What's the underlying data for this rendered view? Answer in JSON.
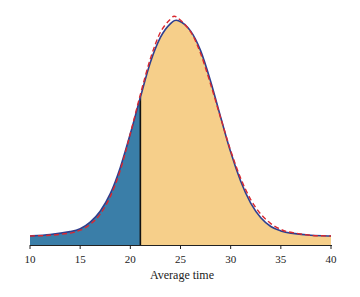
{
  "chart_data": {
    "type": "area",
    "title": "",
    "xlabel": "Average time",
    "ylabel": "",
    "xlim": [
      10,
      40
    ],
    "x_ticks": [
      10,
      15,
      20,
      25,
      30,
      35,
      40
    ],
    "grid": false,
    "legend": null,
    "cutoff": 21,
    "series": [
      {
        "name": "Sampling distribution (solid)",
        "style": "solid",
        "color": "#2e3f8f",
        "x": [
          10,
          12,
          14,
          15,
          16,
          17,
          18,
          19,
          20,
          21,
          22,
          23,
          24,
          24.8,
          26,
          27,
          28,
          29,
          30,
          31,
          32,
          33,
          34,
          35,
          36,
          38,
          40
        ],
        "y": [
          0.0,
          0.002,
          0.006,
          0.01,
          0.019,
          0.034,
          0.058,
          0.094,
          0.14,
          0.19,
          0.238,
          0.272,
          0.291,
          0.295,
          0.281,
          0.254,
          0.212,
          0.163,
          0.115,
          0.075,
          0.045,
          0.025,
          0.013,
          0.007,
          0.004,
          0.001,
          0.0
        ]
      },
      {
        "name": "Normal approximation (dashed)",
        "style": "dashed",
        "color": "#d9282f",
        "x": [
          10,
          12,
          14,
          15,
          16,
          17,
          18,
          19,
          20,
          21,
          22,
          23,
          24,
          24.6,
          26,
          27,
          28,
          29,
          30,
          31,
          32,
          33,
          34,
          35,
          36,
          38,
          40
        ],
        "y": [
          0.0,
          0.001,
          0.004,
          0.008,
          0.016,
          0.03,
          0.054,
          0.09,
          0.14,
          0.194,
          0.243,
          0.279,
          0.297,
          0.3,
          0.28,
          0.25,
          0.208,
          0.162,
          0.117,
          0.079,
          0.05,
          0.03,
          0.017,
          0.009,
          0.005,
          0.001,
          0.0
        ]
      }
    ],
    "fills": [
      {
        "region": "x <= 21",
        "color": "#3a7ea8"
      },
      {
        "region": "x > 21",
        "color": "#f6cf8a"
      }
    ]
  }
}
